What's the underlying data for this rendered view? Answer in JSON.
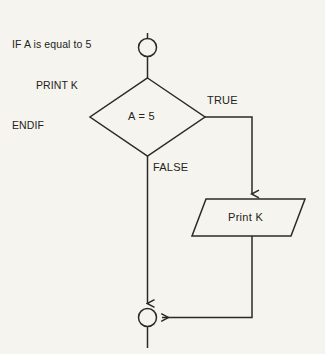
{
  "diagram": {
    "background_color": "#f5f4ee",
    "stroke_color": "#2a2a28",
    "pseudocode": {
      "line1": "IF A is equal to 5",
      "line2": "PRINT K",
      "line3": "ENDIF"
    },
    "nodes": {
      "start_connector": "start-connector",
      "decision": "A = 5",
      "process": "Print K",
      "end_connector": "end-connector"
    },
    "edge_labels": {
      "true": "TRUE",
      "false": "FALSE"
    }
  }
}
